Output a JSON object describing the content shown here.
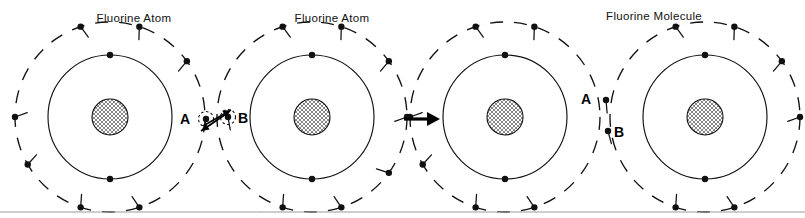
{
  "figure": {
    "width": 805,
    "height": 218,
    "background": "#ffffff",
    "ink_color": "#111111",
    "baseline_rule_color": "#9a9a9a",
    "baseline_rule_y": 212
  },
  "captions": [
    {
      "id": "caption-left-atom",
      "text": "Fluorine Atom",
      "x": 134,
      "y": 22
    },
    {
      "id": "caption-right-atom",
      "text": "Fluorine Atom",
      "x": 332,
      "y": 22
    },
    {
      "id": "caption-molecule",
      "text": "Fluorine  Molecule",
      "x": 654,
      "y": 20
    }
  ],
  "atoms": [
    {
      "id": "atom-1",
      "role": "free-atom-left",
      "cx": 110,
      "cy": 117,
      "nucleus_r": 18,
      "inner_shell_r": 62,
      "outer_shell_r": 95,
      "inner_electron_count": 2,
      "outer_electron_count": 7,
      "inner_electron_angles": [
        -90,
        90
      ],
      "outer_electron_angles": [
        -108,
        -72,
        -36,
        180,
        150,
        72,
        108
      ],
      "outer_electron_tails": [
        -18,
        -16,
        -14,
        -20,
        -18,
        -16,
        -14
      ]
    },
    {
      "id": "atom-2",
      "role": "free-atom-right",
      "cx": 312,
      "cy": 117,
      "nucleus_r": 18,
      "inner_shell_r": 62,
      "outer_shell_r": 95,
      "inner_electron_count": 2,
      "outer_electron_count": 7,
      "inner_electron_angles": [
        -90,
        90
      ],
      "outer_electron_angles": [
        -108,
        -72,
        -36,
        0,
        72,
        108,
        36
      ],
      "outer_electron_tails": [
        -18,
        -16,
        -14,
        -20,
        -16,
        -14,
        -18
      ]
    },
    {
      "id": "atom-3",
      "role": "bonded-atom-left",
      "cx": 505,
      "cy": 117,
      "nucleus_r": 18,
      "inner_shell_r": 62,
      "outer_shell_r": 95,
      "inner_electron_count": 2,
      "outer_electron_count": 6,
      "inner_electron_angles": [
        -90,
        90
      ],
      "outer_electron_angles": [
        -108,
        -72,
        180,
        150,
        72,
        108
      ],
      "outer_electron_tails": [
        -18,
        -16,
        -20,
        -18,
        -16,
        -14
      ]
    },
    {
      "id": "atom-4",
      "role": "bonded-atom-right",
      "cx": 705,
      "cy": 117,
      "nucleus_r": 18,
      "inner_shell_r": 62,
      "outer_shell_r": 95,
      "inner_electron_count": 2,
      "outer_electron_count": 6,
      "inner_electron_angles": [
        -90,
        90
      ],
      "outer_electron_angles": [
        -108,
        -72,
        -36,
        0,
        72,
        108
      ],
      "outer_electron_tails": [
        -18,
        -16,
        -14,
        -20,
        -16,
        -14
      ]
    }
  ],
  "valence_electrons_left_pair": {
    "label_a": "A",
    "label_b": "B",
    "electron_a": {
      "x": 206,
      "y": 119
    },
    "electron_b": {
      "x": 228,
      "y": 117
    },
    "label_a_pos": {
      "x": 190,
      "y": 124
    },
    "label_b_pos": {
      "x": 238,
      "y": 123
    },
    "attraction_arrows": [
      {
        "from_x": 203,
        "from_y": 126,
        "to_x": 231,
        "to_y": 110,
        "direction": "up-right"
      },
      {
        "from_x": 229,
        "from_y": 112,
        "to_x": 201,
        "to_y": 131,
        "direction": "down-left"
      }
    ]
  },
  "valence_electrons_molecule": {
    "label_a": "A",
    "label_b": "B",
    "electron_a": {
      "x": 606,
      "y": 100
    },
    "electron_b": {
      "x": 608,
      "y": 131
    },
    "label_a_pos": {
      "x": 591,
      "y": 104
    },
    "label_b_pos": {
      "x": 614,
      "y": 137
    }
  },
  "reaction_arrow": {
    "id": "reaction-arrow",
    "from_x": 404,
    "to_x": 440,
    "y": 119,
    "head_length": 13,
    "head_half_width": 7
  },
  "legend": {
    "nucleus_pattern": "cross-hatch",
    "inner_shell_style": "solid",
    "outer_shell_style": "dashed",
    "electron_glyph": "filled-dot-with-tail"
  }
}
